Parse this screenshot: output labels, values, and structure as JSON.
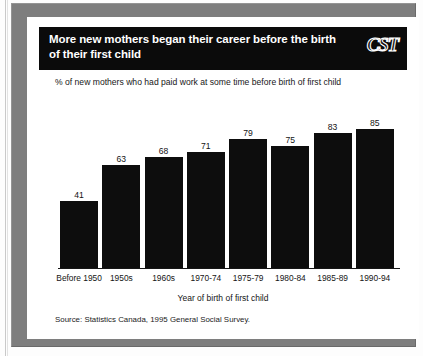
{
  "frame": {
    "frame_color": "#7e7e7e",
    "card_color": "#ffffff"
  },
  "header": {
    "title": "More new mothers began their career before the birth of their first child",
    "logo_text": "CST",
    "band_color": "#0b0b0b"
  },
  "subtitle": "% of new mothers who had paid work at some time before birth of first child",
  "source": "Source: Statistics Canada, 1995 General Social Survey.",
  "chart_data": {
    "type": "bar",
    "title": "More new mothers began their career before the birth of their first child",
    "subtitle": "% of new mothers who had paid work at some time before birth of first child",
    "xlabel": "Year of birth of first child",
    "ylabel": "",
    "categories": [
      "Before 1950",
      "1950s",
      "1960s",
      "1970-74",
      "1975-79",
      "1980-84",
      "1985-89",
      "1990-94"
    ],
    "values": [
      41,
      63,
      68,
      71,
      79,
      75,
      83,
      85
    ],
    "ylim": [
      0,
      100
    ],
    "grid": false,
    "legend": false,
    "bar_color": "#0d0d0d",
    "source": "Source: Statistics Canada, 1995 General Social Survey."
  }
}
